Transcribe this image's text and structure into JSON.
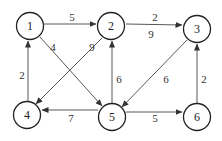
{
  "graph": {
    "nodes": [
      {
        "id": "1",
        "label": "1",
        "x": 30,
        "y": 26
      },
      {
        "id": "2",
        "label": "2",
        "x": 111,
        "y": 26
      },
      {
        "id": "3",
        "label": "3",
        "x": 197,
        "y": 29
      },
      {
        "id": "4",
        "label": "4",
        "x": 27,
        "y": 115
      },
      {
        "id": "5",
        "label": "5",
        "x": 112,
        "y": 117
      },
      {
        "id": "6",
        "label": "6",
        "x": 197,
        "y": 117
      }
    ],
    "edges": [
      {
        "from": "1",
        "to": "2",
        "weight": "5"
      },
      {
        "from": "2",
        "to": "3",
        "weight": "2"
      },
      {
        "from": "2",
        "to": "4",
        "weight": "9"
      },
      {
        "from": "1",
        "to": "5",
        "weight": "4"
      },
      {
        "from": "4",
        "to": "1",
        "weight": "2"
      },
      {
        "from": "5",
        "to": "2",
        "weight": "6"
      },
      {
        "from": "3",
        "to": "5",
        "weight": "6"
      },
      {
        "from": "5",
        "to": "4",
        "weight": "7"
      },
      {
        "from": "5",
        "to": "6",
        "weight": "5"
      },
      {
        "from": "6",
        "to": "3",
        "weight": "2"
      }
    ],
    "extra_labels": [
      {
        "text": "9",
        "x": 151,
        "y": 34
      }
    ]
  }
}
